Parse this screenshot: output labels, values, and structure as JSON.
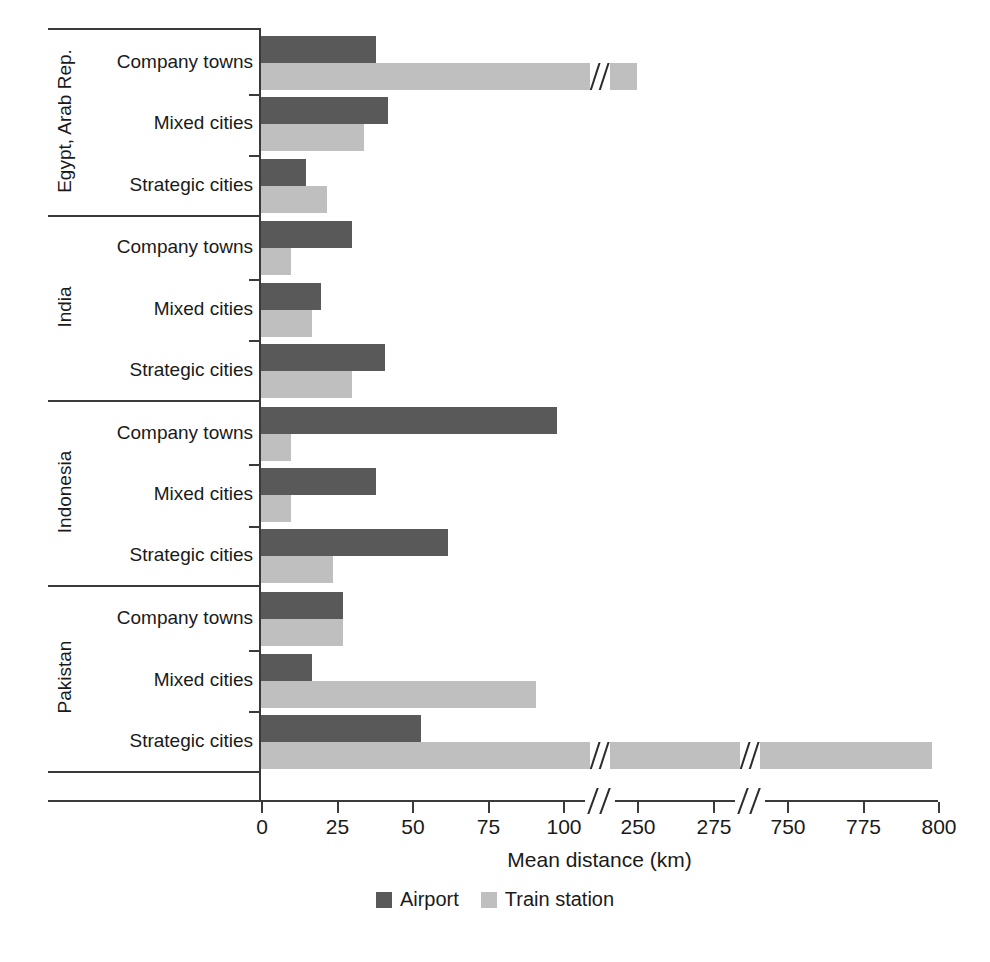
{
  "chart_data": {
    "type": "bar",
    "orientation": "horizontal",
    "title": "",
    "xlabel": "Mean distance (km)",
    "ylabel": "",
    "grid": false,
    "legend_position": "bottom-center",
    "xlim": [
      0,
      800
    ],
    "x_axis_broken": true,
    "x_tick_labels": [
      "0",
      "25",
      "50",
      "75",
      "100",
      "250",
      "275",
      "750",
      "775",
      "800"
    ],
    "x_tick_values": [
      0,
      25,
      50,
      75,
      100,
      250,
      275,
      750,
      775,
      800
    ],
    "x_break_segments": [
      [
        0,
        100
      ],
      [
        250,
        275
      ],
      [
        750,
        800
      ]
    ],
    "series": [
      {
        "name": "Airport",
        "color": "#595959"
      },
      {
        "name": "Train station",
        "color": "#bfbfbf"
      }
    ],
    "groups": [
      {
        "country": "Egypt, Arab Rep.",
        "categories": [
          "Company towns",
          "Mixed cities",
          "Strategic cities"
        ],
        "airport": [
          38,
          42,
          15
        ],
        "train_station": [
          250,
          34,
          22
        ]
      },
      {
        "country": "India",
        "categories": [
          "Company towns",
          "Mixed cities",
          "Strategic cities"
        ],
        "airport": [
          30,
          20,
          41
        ],
        "train_station": [
          10,
          17,
          30
        ]
      },
      {
        "country": "Indonesia",
        "categories": [
          "Company towns",
          "Mixed cities",
          "Strategic cities"
        ],
        "airport": [
          98,
          38,
          62
        ],
        "train_station": [
          10,
          10,
          24
        ]
      },
      {
        "country": "Pakistan",
        "categories": [
          "Company towns",
          "Mixed cities",
          "Strategic cities"
        ],
        "airport": [
          27,
          17,
          53
        ],
        "train_station": [
          27,
          91,
          798
        ]
      }
    ]
  },
  "axis": {
    "x_title": "Mean distance (km)",
    "ticks": [
      {
        "label": "0",
        "value": 0
      },
      {
        "label": "25",
        "value": 25
      },
      {
        "label": "50",
        "value": 50
      },
      {
        "label": "75",
        "value": 75
      },
      {
        "label": "100",
        "value": 100
      },
      {
        "label": "250",
        "value": 250
      },
      {
        "label": "275",
        "value": 275
      },
      {
        "label": "750",
        "value": 750
      },
      {
        "label": "775",
        "value": 775
      },
      {
        "label": "800",
        "value": 800
      }
    ]
  },
  "legend": {
    "items": [
      {
        "label": "Airport",
        "color": "#595959"
      },
      {
        "label": "Train station",
        "color": "#bfbfbf"
      }
    ]
  },
  "colors": {
    "airport": "#595959",
    "train_station": "#bfbfbf",
    "axis": "#3a3a3a",
    "text": "#1a1a1a",
    "background": "#ffffff"
  }
}
